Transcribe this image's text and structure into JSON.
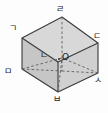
{
  "figure": {
    "shape": "cube",
    "projection": "oblique",
    "background_color": "#fdfdfd",
    "stroke_color": "#3a3a3a",
    "hidden_stroke_color": "#6b6b6b",
    "face_colors": {
      "top": "#d6d6d6",
      "left": "#c9c9c9",
      "front": "#d2d2d2",
      "right": "#cfcfcf"
    },
    "vertices": [
      {
        "id": "v-top-left",
        "label": "ㄱ",
        "x": 14,
        "y": 29
      },
      {
        "id": "v-inner-front",
        "label": "ㄴ",
        "x": 45,
        "y": 56
      },
      {
        "id": "v-top-right",
        "label": "ㄷ",
        "x": 95,
        "y": 36
      },
      {
        "id": "v-top-back",
        "label": "ㄹ",
        "x": 59,
        "y": 10
      },
      {
        "id": "v-bottom-left",
        "label": "ㅁ",
        "x": 9,
        "y": 71
      },
      {
        "id": "v-bottom-front",
        "label": "ㅂ",
        "x": 56,
        "y": 96
      },
      {
        "id": "v-bottom-right",
        "label": "ㅅ",
        "x": 94,
        "y": 77
      }
    ],
    "center": {
      "id": "center-point",
      "label": "O",
      "x": 62,
      "y": 58
    },
    "edges": {
      "solid_count": 9,
      "hidden_dashed_count": 3,
      "diagonal_dashed_count": 3
    }
  }
}
